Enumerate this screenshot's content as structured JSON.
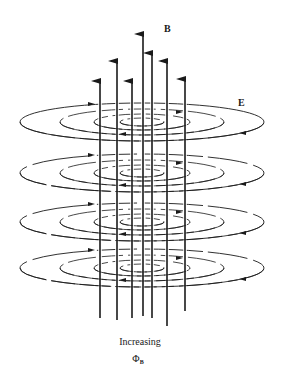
{
  "diagram": {
    "labels": {
      "b_field": "B",
      "e_field": "E",
      "caption_line1": "Increasing",
      "caption_symbol": "Φ",
      "caption_subscript": "B"
    },
    "colors": {
      "ink": "#1a1a1a",
      "background": "#ffffff"
    },
    "center_x": 142,
    "b_arrows": [
      {
        "x": 100,
        "top": 72,
        "bottom": 318
      },
      {
        "x": 117,
        "top": 52,
        "bottom": 320
      },
      {
        "x": 132,
        "top": 72,
        "bottom": 318
      },
      {
        "x": 143,
        "top": 25,
        "bottom": 316
      },
      {
        "x": 152,
        "top": 44,
        "bottom": 318
      },
      {
        "x": 167,
        "top": 52,
        "bottom": 326
      },
      {
        "x": 185,
        "top": 70,
        "bottom": 311
      }
    ],
    "e_layers": [
      {
        "cy": 122,
        "direction": "counterclockwise"
      },
      {
        "cy": 173,
        "direction": "counterclockwise"
      },
      {
        "cy": 222,
        "direction": "counterclockwise"
      },
      {
        "cy": 268,
        "direction": "counterclockwise"
      }
    ],
    "e_rings": [
      {
        "rx": 122,
        "ry": 19
      },
      {
        "rx": 82,
        "ry": 13
      },
      {
        "rx": 48,
        "ry": 8
      },
      {
        "rx": 22,
        "ry": 4
      }
    ]
  }
}
